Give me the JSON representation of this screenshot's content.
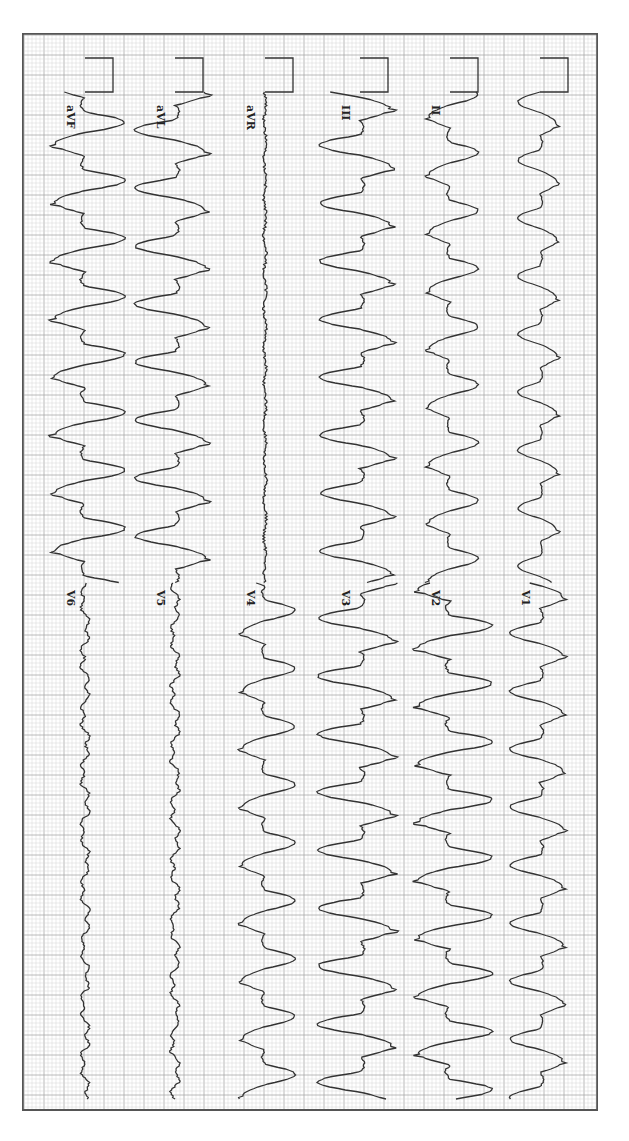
{
  "chart_data": {
    "type": "line",
    "orientation": "rotated-90-clockwise",
    "grid": {
      "minor_px": 4,
      "major_px": 20,
      "minor_color": "#d4d4d4",
      "major_color": "#a8a8a8"
    },
    "trace_color": "#333333",
    "calibration_pulse": {
      "present": true,
      "y_start": 58,
      "y_end": 92,
      "amplitude_px": 28
    },
    "segments": [
      {
        "name": "limb-leads",
        "y_start": 92,
        "y_end": 583
      },
      {
        "name": "precordial-leads",
        "y_start": 583,
        "y_end": 1100
      }
    ],
    "columns": [
      {
        "baseline_x": 540,
        "limb_label": "",
        "chest_label": "V1",
        "limb_amp": 22,
        "chest_amp": 30,
        "morph_limb": "wide",
        "morph_chest": "wide"
      },
      {
        "baseline_x": 450,
        "limb_label": "II",
        "chest_label": "V2",
        "limb_amp": 28,
        "chest_amp": 42,
        "morph_limb": "wide",
        "morph_chest": "wide"
      },
      {
        "baseline_x": 360,
        "limb_label": "III",
        "chest_label": "V3",
        "limb_amp": 40,
        "chest_amp": 42,
        "morph_limb": "wide",
        "morph_chest": "wide"
      },
      {
        "baseline_x": 265,
        "limb_label": "aVR",
        "chest_label": "V4",
        "limb_amp": 3,
        "chest_amp": 30,
        "morph_limb": "flat",
        "morph_chest": "wide"
      },
      {
        "baseline_x": 175,
        "limb_label": "aVL",
        "chest_label": "V5",
        "limb_amp": 40,
        "chest_amp": 10,
        "morph_limb": "wide",
        "morph_chest": "small"
      },
      {
        "baseline_x": 85,
        "limb_label": "aVF",
        "chest_label": "V6",
        "limb_amp": 40,
        "chest_amp": 10,
        "morph_limb": "wide",
        "morph_chest": "small"
      }
    ],
    "leads": [
      "I",
      "II",
      "III",
      "aVR",
      "aVL",
      "aVF",
      "V1",
      "V2",
      "V3",
      "V4",
      "V5",
      "V6"
    ],
    "rhythm": {
      "description": "wide-complex tachycardia",
      "beat_period_px": 58,
      "approx_beats_per_segment": 8
    }
  },
  "labels": {
    "I": "",
    "II": "II",
    "III": "III",
    "aVR": "aVR",
    "aVL": "aVL",
    "aVF": "aVF",
    "V1": "V1",
    "V2": "V2",
    "V3": "V3",
    "V4": "V4",
    "V5": "V5",
    "V6": "V6"
  }
}
